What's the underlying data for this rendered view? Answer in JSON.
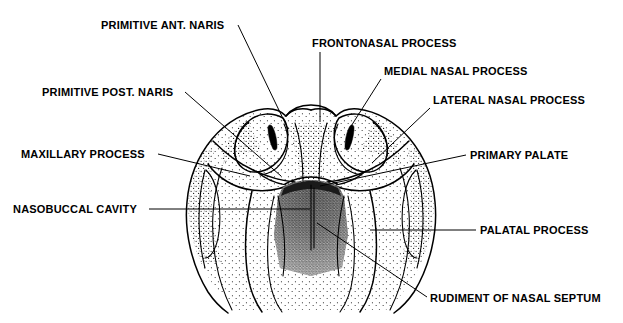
{
  "figure": {
    "background_color": "#ffffff",
    "ink_color": "#000000"
  },
  "labels": {
    "primitive_ant_naris": "PRIMITIVE ANT. NARIS",
    "primitive_post_naris": "PRIMITIVE POST. NARIS",
    "maxillary_process": "MAXILLARY PROCESS",
    "nasobuccal_cavity": "NASOBUCCAL CAVITY",
    "frontonasal_process": "FRONTONASAL PROCESS",
    "medial_nasal_process": "MEDIAL NASAL PROCESS",
    "lateral_nasal_process": "LATERAL NASAL PROCESS",
    "primary_palate": "PRIMARY PALATE",
    "palatal_process": "PALATAL PROCESS",
    "rudiment_of_nasal_septum": "RUDIMENT OF NASAL SEPTUM"
  },
  "annotations": [
    {
      "id": "primitive-ant-naris",
      "text": "PRIMITIVE ANT. NARIS",
      "side": "left",
      "text_x": 101,
      "text_y": 29,
      "leader": "M 238 25 L 288 129",
      "target": {
        "x": 288,
        "y": 129
      }
    },
    {
      "id": "primitive-post-naris",
      "text": "PRIMITIVE POST. NARIS",
      "side": "left",
      "text_x": 42,
      "text_y": 96,
      "leader": "M 185 92 L 281 176",
      "target": {
        "x": 281,
        "y": 176
      }
    },
    {
      "id": "maxillary-process",
      "text": "MAXILLARY PROCESS",
      "side": "left",
      "text_x": 21,
      "text_y": 158,
      "leader": "M 158 154 L 250 176",
      "target": {
        "x": 250,
        "y": 176
      }
    },
    {
      "id": "nasobuccal-cavity",
      "text": "NASOBUCCAL CAVITY",
      "side": "left",
      "text_x": 13,
      "text_y": 212,
      "leader": "M 149 209 L 310 209",
      "target": {
        "x": 310,
        "y": 209
      }
    },
    {
      "id": "frontonasal-process",
      "text": "FRONTONASAL PROCESS",
      "side": "right",
      "text_x": 312,
      "text_y": 47,
      "leader": "M 320 52 L 320 122",
      "target": {
        "x": 320,
        "y": 122
      }
    },
    {
      "id": "medial-nasal-process",
      "text": "MEDIAL NASAL PROCESS",
      "side": "right",
      "text_x": 384,
      "text_y": 75,
      "leader": "M 381 79 L 348 131",
      "target": {
        "x": 348,
        "y": 131
      }
    },
    {
      "id": "lateral-nasal-process",
      "text": "LATERAL NASAL PROCESS",
      "side": "right",
      "text_x": 434,
      "text_y": 104,
      "leader": "M 430 108 L 372 163",
      "target": {
        "x": 372,
        "y": 163
      }
    },
    {
      "id": "primary-palate",
      "text": "PRIMARY PALATE",
      "side": "right",
      "text_x": 470,
      "text_y": 158,
      "leader": "M 466 155 L 320 186",
      "target": {
        "x": 320,
        "y": 186
      }
    },
    {
      "id": "palatal-process",
      "text": "PALATAL PROCESS",
      "side": "right",
      "text_x": 480,
      "text_y": 233,
      "leader": "M 476 230 L 370 230",
      "target": {
        "x": 370,
        "y": 230
      }
    },
    {
      "id": "rudiment-of-nasal-septum",
      "text": "RUDIMENT OF NASAL SEPTUM",
      "side": "bottom",
      "text_x": 430,
      "text_y": 302,
      "leader": "M 427 297 L 317 223 L 317 185",
      "target": {
        "x": 317,
        "y": 185
      }
    }
  ],
  "drawing": {
    "type": "line-and-stipple anatomical illustration",
    "structures": [
      "frontonasal process",
      "medial nasal process (left and right)",
      "lateral nasal process (left and right)",
      "maxillary process (left and right)",
      "palatal process (left and right)",
      "primary palate",
      "nasobuccal cavity",
      "rudiment of nasal septum",
      "primitive anterior naris (left and right)",
      "primitive posterior naris (left and right)"
    ],
    "naris_count": 2,
    "symmetry": "bilateral about vertical midline x=311"
  }
}
